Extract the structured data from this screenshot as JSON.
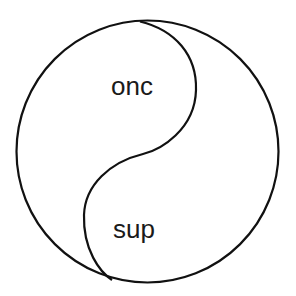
{
  "diagram": {
    "type": "yin-yang",
    "labels": {
      "top": "onc",
      "bottom": "sup"
    },
    "stroke_color": "#111111",
    "background": "#ffffff"
  }
}
